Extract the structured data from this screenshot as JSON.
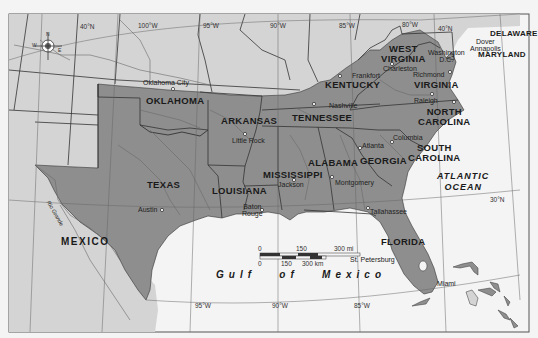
{
  "map": {
    "title": "Southern United States",
    "colors": {
      "confederate_states": "#8e8e8e",
      "other_land": "#d4d4d4",
      "water": "#f4f4f4",
      "border": "#333333",
      "river": "#6a6a6a",
      "frame": "#555555"
    },
    "states": [
      {
        "id": "texas",
        "label": "TEXAS"
      },
      {
        "id": "oklahoma",
        "label": "OKLAHOMA"
      },
      {
        "id": "arkansas",
        "label": "ARKANSAS"
      },
      {
        "id": "louisiana",
        "label": "LOUISIANA"
      },
      {
        "id": "mississippi",
        "label": "MISSISSIPPI"
      },
      {
        "id": "alabama",
        "label": "ALABAMA"
      },
      {
        "id": "tennessee",
        "label": "TENNESSEE"
      },
      {
        "id": "kentucky",
        "label": "KENTUCKY"
      },
      {
        "id": "georgia",
        "label": "GEORGIA"
      },
      {
        "id": "florida",
        "label": "FLORIDA"
      },
      {
        "id": "south_carolina",
        "label_line1": "SOUTH",
        "label_line2": "CAROLINA"
      },
      {
        "id": "north_carolina",
        "label_line1": "NORTH",
        "label_line2": "CAROLINA"
      },
      {
        "id": "virginia",
        "label": "VIRGINIA"
      },
      {
        "id": "west_virginia",
        "label_line1": "WEST",
        "label_line2": "VIRGINIA"
      },
      {
        "id": "maryland",
        "label": "MARYLAND"
      },
      {
        "id": "delaware",
        "label": "DELAWARE"
      }
    ],
    "cities": [
      {
        "id": "oklahoma_city",
        "label": "Oklahoma City"
      },
      {
        "id": "little_rock",
        "label": "Little Rock"
      },
      {
        "id": "austin",
        "label": "Austin"
      },
      {
        "id": "baton_rouge",
        "label_line1": "Baton",
        "label_line2": "Rouge"
      },
      {
        "id": "jackson",
        "label": "Jackson"
      },
      {
        "id": "montgomery",
        "label": "Montgomery"
      },
      {
        "id": "nashville",
        "label": "Nashville"
      },
      {
        "id": "frankfort",
        "label": "Frankfort"
      },
      {
        "id": "atlanta",
        "label": "Atlanta"
      },
      {
        "id": "columbia",
        "label": "Columbia"
      },
      {
        "id": "tallahassee",
        "label": "Tallahassee"
      },
      {
        "id": "st_petersburg",
        "label": "St. Petersburg"
      },
      {
        "id": "miami",
        "label": "Miami"
      },
      {
        "id": "raleigh",
        "label": "Raleigh"
      },
      {
        "id": "richmond",
        "label": "Richmond"
      },
      {
        "id": "charleston",
        "label": "Charleston"
      },
      {
        "id": "washington",
        "label_line1": "Washington",
        "label_line2": "D.C."
      },
      {
        "id": "dover",
        "label": "Dover"
      },
      {
        "id": "annapolis",
        "label": "Annapolis"
      }
    ],
    "countries": [
      {
        "id": "mexico",
        "label": "MEXICO"
      }
    ],
    "water_bodies": [
      {
        "id": "atlantic",
        "label_line1": "ATLANTIC",
        "label_line2": "OCEAN"
      },
      {
        "id": "gulf",
        "label": "Gulf   of   Mexico"
      }
    ],
    "rivers": [
      {
        "id": "rio_grande",
        "label": "Rio Grande"
      }
    ],
    "graticule": {
      "top": [
        "40°N",
        "100°W",
        "95°W",
        "90°W",
        "85°W",
        "80°W",
        "40°N"
      ],
      "bottom": [
        "95°W",
        "90°W",
        "85°W"
      ],
      "lat_right": "30°N"
    },
    "compass": {
      "n": "N",
      "s": "S",
      "e": "E",
      "w": "W"
    },
    "scale_bar": {
      "mi_ticks": [
        "0",
        "150",
        "300 mi"
      ],
      "km_ticks": [
        "0",
        "150",
        "300 km"
      ]
    }
  }
}
